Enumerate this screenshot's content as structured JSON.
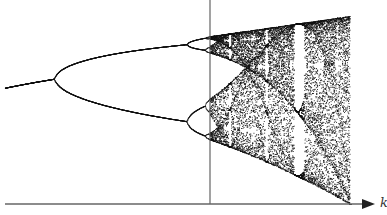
{
  "chart_data": {
    "type": "scatter",
    "title": "",
    "subtitle": "Bifurcation diagram of the logistic map x_{n+1} = k x_n (1 - x_n)",
    "xlabel": "k",
    "ylabel": "",
    "x_tick_labels": [],
    "y_tick_labels": [],
    "grid": false,
    "legend": null,
    "xlim": [
      2.6,
      4.0
    ],
    "ylim": [
      0.0,
      1.0
    ],
    "x_range_k": [
      2.62,
      4.0
    ],
    "vertical_marker_k": 3.5699,
    "features": {
      "first_bifurcation_k": 3.0,
      "second_bifurcation_k": 3.449,
      "onset_of_chaos_k": 3.5699,
      "period_3_window_k": [
        3.828,
        3.857
      ],
      "period_4_points_at_marker": 4,
      "upper_envelope_max_x": 1.0
    },
    "annotations": [
      {
        "label": "k",
        "position": "end of horizontal axis arrow"
      }
    ],
    "colors": {
      "points": "#111111",
      "axes": "#444444",
      "background": "#ffffff"
    }
  },
  "axes": {
    "x_label": "k"
  }
}
